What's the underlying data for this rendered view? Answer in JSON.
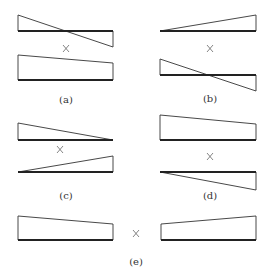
{
  "diagram": {
    "panels": [
      {
        "id": "a",
        "label": "(a)",
        "operator": "×",
        "top_shape": "bending-moment-antisymmetric-triangle",
        "bottom_shape": "trapezoid-decreasing-right"
      },
      {
        "id": "b",
        "label": "(b)",
        "operator": "×",
        "top_shape": "triangle-increasing-right",
        "bottom_shape": "bending-moment-antisymmetric-triangle"
      },
      {
        "id": "c",
        "label": "(c)",
        "operator": "×",
        "top_shape": "triangle-decreasing-right",
        "bottom_shape": "triangle-increasing-right"
      },
      {
        "id": "d",
        "label": "(d)",
        "operator": "×",
        "top_shape": "trapezoid-decreasing-right",
        "bottom_shape": "triangle-below-increasing-right"
      },
      {
        "id": "e",
        "label": "(e)",
        "operator": "×",
        "left_shape": "trapezoid-decreasing-right",
        "right_shape": "trapezoid-increasing-right"
      }
    ],
    "colors": {
      "line": "#333333",
      "baseline": "#222222",
      "operator": "#666666",
      "background": "#ffffff"
    }
  }
}
